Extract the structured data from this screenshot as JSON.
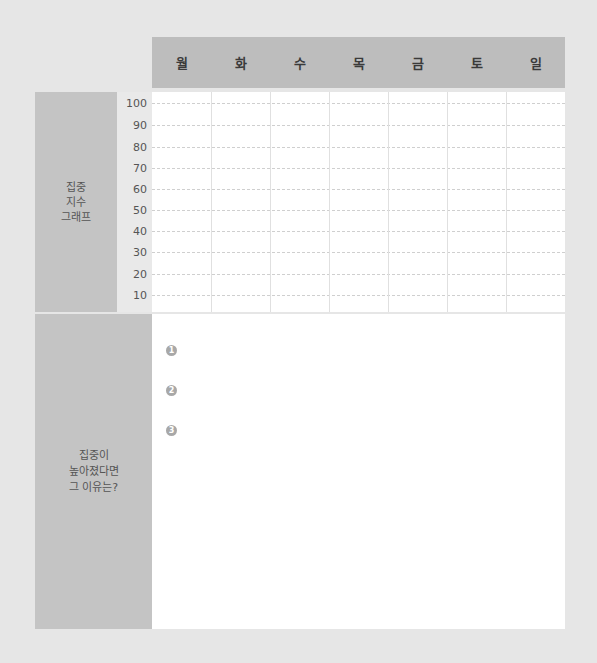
{
  "header": {
    "days": [
      "월",
      "화",
      "수",
      "목",
      "금",
      "토",
      "일"
    ]
  },
  "graph_section": {
    "label_lines": [
      "집중",
      "지수",
      "그래프"
    ],
    "y_ticks": [
      "100",
      "90",
      "80",
      "70",
      "60",
      "50",
      "40",
      "30",
      "20",
      "10"
    ]
  },
  "reason_section": {
    "label_lines": [
      "집중이",
      "높아졌다면",
      "그 이유는?"
    ],
    "items": [
      "1",
      "2",
      "3"
    ]
  },
  "colors": {
    "header_bg": "#bdbdbd",
    "label_bg": "#c4c4c4",
    "page_bg": "#e6e6e6"
  }
}
